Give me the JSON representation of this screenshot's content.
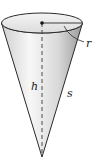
{
  "diagram": {
    "labels": {
      "radius": "r",
      "height": "h",
      "slant_height": "s"
    },
    "colors": {
      "outline": "#2a2a2a",
      "fill_light": "#f2f2f2",
      "fill_mid": "#d6d6d6",
      "fill_dark": "#a8a8a8",
      "top_face": "#e6e6e6"
    }
  }
}
